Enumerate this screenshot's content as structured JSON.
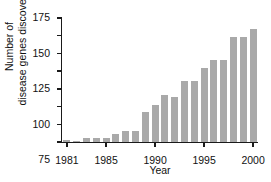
{
  "chart_data": {
    "type": "bar",
    "title": "",
    "xlabel": "Year",
    "ylabel": "Number of disease genes discovered",
    "ylabel_lines": [
      "Number of",
      "disease genes discovered"
    ],
    "categories": [
      "1981",
      "1982",
      "1983",
      "1984",
      "1985",
      "1986",
      "1987",
      "1988",
      "1989",
      "1990",
      "1991",
      "1992",
      "1993",
      "1994",
      "1995",
      "1996",
      "1997",
      "1998",
      "1999",
      "2000"
    ],
    "values": [
      3,
      1,
      5,
      5,
      5,
      11,
      15,
      15,
      43,
      52,
      66,
      63,
      86,
      86,
      104,
      116,
      116,
      148,
      148,
      160
    ],
    "ylim": [
      0,
      175
    ],
    "yticks": [
      0,
      25,
      50,
      75,
      100,
      125,
      150,
      175
    ],
    "ytick_labels": [
      "0",
      "25",
      "50",
      "75",
      "100",
      "125",
      "150",
      "175"
    ],
    "xtick_labels": [
      "1981",
      "1985",
      "1990",
      "1995",
      "2000"
    ],
    "xtick_categories": [
      "1981",
      "1985",
      "1990",
      "1995",
      "2000"
    ],
    "grid": false,
    "legend": false,
    "bar_color": "#a9a9a9",
    "axis_color": "#1a1a1a",
    "background": "#ffffff"
  }
}
